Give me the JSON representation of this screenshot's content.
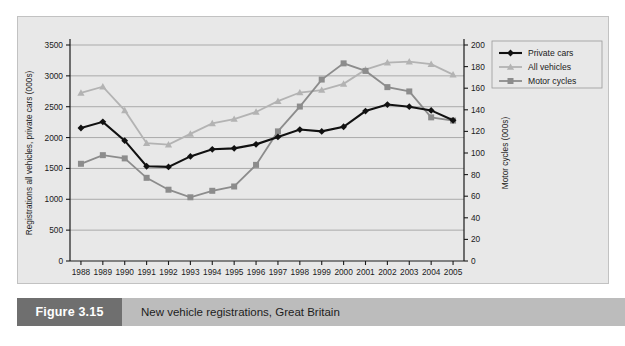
{
  "figure": {
    "number_label": "Figure 3.15",
    "caption": "New vehicle registrations, Great Britain"
  },
  "colors": {
    "panel_background": "#e8e8e8",
    "panel_border": "#c2c2c2",
    "caption_bar": "#bcbcbc",
    "figure_number_box": "#6f6f6f",
    "gridline": "#8f8f8f",
    "axis": "#1a1a1a",
    "private_cars": "#111111",
    "all_vehicles": "#b3b3b3",
    "motor_cycles": "#8c8c8c"
  },
  "chart_data": {
    "type": "line",
    "title": "",
    "xlabel": "",
    "ylabel": "Registrations all vehicles, private cars (000s)",
    "y2label": "Motor cycles (000s)",
    "grid": true,
    "legend_position": "top-right",
    "ylim": [
      0,
      3500
    ],
    "y2lim": [
      0,
      200
    ],
    "yticks": [
      0,
      500,
      1000,
      1500,
      2000,
      2500,
      3000,
      3500
    ],
    "y2ticks": [
      0,
      20,
      40,
      60,
      80,
      100,
      120,
      140,
      160,
      180,
      200
    ],
    "categories": [
      "1988",
      "1989",
      "1990",
      "1991",
      "1992",
      "1993",
      "1994",
      "1995",
      "1996",
      "1997",
      "1998",
      "1999",
      "2000",
      "2001",
      "2002",
      "2003",
      "2004",
      "2005"
    ],
    "series": [
      {
        "name": "Private cars",
        "axis": "left",
        "marker": "diamond",
        "color": "#111111",
        "values": [
          2155,
          2255,
          1950,
          1535,
          1525,
          1695,
          1810,
          1825,
          1890,
          2010,
          2130,
          2100,
          2175,
          2430,
          2535,
          2500,
          2440,
          2280
        ]
      },
      {
        "name": "All vehicles",
        "axis": "left",
        "marker": "triangle",
        "color": "#b3b3b3",
        "values": [
          2725,
          2825,
          2440,
          1910,
          1885,
          2060,
          2230,
          2300,
          2415,
          2590,
          2730,
          2770,
          2870,
          3100,
          3215,
          3230,
          3190,
          3020
        ]
      },
      {
        "name": "Motor cycles",
        "axis": "right",
        "marker": "square",
        "color": "#8c8c8c",
        "values": [
          90,
          98,
          95,
          77,
          66,
          59,
          65,
          69,
          89,
          120,
          143,
          168,
          183,
          176,
          161,
          157,
          133,
          130
        ]
      }
    ]
  }
}
